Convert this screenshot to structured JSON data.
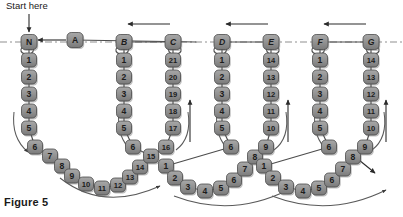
{
  "figure": {
    "caption": "Figure 5",
    "start_label": "Start here"
  },
  "colors": {
    "node_fill": "#8c8c8c",
    "node_fill_light": "#a6a6a6",
    "node_stroke": "#4a4a4a",
    "node_text": "#1c1c1c",
    "link": "#4d4d4d",
    "dashed_axis": "#8f8f8f",
    "arc": "#5a5a5a",
    "arrow": "#2b2b2b",
    "caption_text": "#1a1a1a",
    "background": "#ffffff"
  },
  "axis": {
    "y": 42,
    "style": "dash-dot",
    "label": "horizontal-reference-line"
  },
  "letter_nodes": [
    {
      "id": "N",
      "label": "N",
      "x": 29,
      "y": 42,
      "italic": false
    },
    {
      "id": "A",
      "label": "A",
      "x": 75,
      "y": 40,
      "italic": false
    },
    {
      "id": "B",
      "label": "B",
      "x": 124,
      "y": 42,
      "italic": true
    },
    {
      "id": "C",
      "label": "C",
      "x": 173,
      "y": 42,
      "italic": true
    },
    {
      "id": "D",
      "label": "D",
      "x": 222,
      "y": 42,
      "italic": true
    },
    {
      "id": "E",
      "label": "E",
      "x": 271,
      "y": 42,
      "italic": true
    },
    {
      "id": "F",
      "label": "F",
      "x": 320,
      "y": 42,
      "italic": true
    },
    {
      "id": "G",
      "label": "G",
      "x": 371,
      "y": 42,
      "italic": true
    }
  ],
  "columns": [
    {
      "name": "col-N-down",
      "letter": "N",
      "x": 29,
      "start_y": 60,
      "step": 17,
      "values": [
        "1",
        "2",
        "3",
        "4",
        "5"
      ]
    },
    {
      "name": "col-B-down",
      "letter": "B",
      "x": 124,
      "start_y": 60,
      "step": 17,
      "values": [
        "1",
        "2",
        "3",
        "4",
        "5"
      ]
    },
    {
      "name": "col-C-up",
      "letter": "C",
      "x": 173,
      "start_y": 60,
      "step": 17,
      "values": [
        "21",
        "20",
        "19",
        "18",
        "17"
      ]
    },
    {
      "name": "col-D-down",
      "letter": "D",
      "x": 222,
      "start_y": 60,
      "step": 17,
      "values": [
        "1",
        "2",
        "3",
        "4",
        "5"
      ]
    },
    {
      "name": "col-E-up",
      "letter": "E",
      "x": 271,
      "start_y": 60,
      "step": 17,
      "values": [
        "14",
        "13",
        "12",
        "11",
        "10"
      ]
    },
    {
      "name": "col-F-down",
      "letter": "F",
      "x": 320,
      "start_y": 60,
      "step": 17,
      "values": [
        "1",
        "2",
        "3",
        "4",
        "5"
      ]
    },
    {
      "name": "col-G-up",
      "letter": "G",
      "x": 371,
      "start_y": 60,
      "step": 17,
      "values": [
        "14",
        "13",
        "12",
        "11",
        "10"
      ]
    }
  ],
  "arc_nodes": [
    {
      "name": "arc1-node",
      "label": "6",
      "x": 35,
      "y": 147
    },
    {
      "name": "arc1-node",
      "label": "7",
      "x": 50,
      "y": 156
    },
    {
      "name": "arc1-node",
      "label": "8",
      "x": 62,
      "y": 166
    },
    {
      "name": "arc1-node",
      "label": "9",
      "x": 72,
      "y": 176
    },
    {
      "name": "arc1-node",
      "label": "10",
      "x": 86,
      "y": 184
    },
    {
      "name": "arc1-node",
      "label": "11",
      "x": 102,
      "y": 188
    },
    {
      "name": "arc1-node",
      "label": "12",
      "x": 118,
      "y": 185
    },
    {
      "name": "arc1-node",
      "label": "13",
      "x": 130,
      "y": 177
    },
    {
      "name": "arc1-node",
      "label": "14",
      "x": 140,
      "y": 167
    },
    {
      "name": "arc1-node",
      "label": "15",
      "x": 151,
      "y": 156
    },
    {
      "name": "arc1-node",
      "label": "16",
      "x": 166,
      "y": 147
    },
    {
      "name": "arc2-node",
      "label": "1",
      "x": 166,
      "y": 166
    },
    {
      "name": "arc2-node",
      "label": "2",
      "x": 175,
      "y": 178
    },
    {
      "name": "arc2-node",
      "label": "3",
      "x": 188,
      "y": 187
    },
    {
      "name": "arc2-node",
      "label": "4",
      "x": 205,
      "y": 191
    },
    {
      "name": "arc2-node",
      "label": "5",
      "x": 221,
      "y": 188
    },
    {
      "name": "arc2-node",
      "label": "6",
      "x": 234,
      "y": 180
    },
    {
      "name": "arc2-node",
      "label": "7",
      "x": 245,
      "y": 169
    },
    {
      "name": "arc2-node",
      "label": "8",
      "x": 255,
      "y": 157
    },
    {
      "name": "arc2-node",
      "label": "9",
      "x": 266,
      "y": 147
    },
    {
      "name": "arc3-node",
      "label": "1",
      "x": 264,
      "y": 166
    },
    {
      "name": "arc3-node",
      "label": "2",
      "x": 273,
      "y": 178
    },
    {
      "name": "arc3-node",
      "label": "3",
      "x": 286,
      "y": 187
    },
    {
      "name": "arc3-node",
      "label": "4",
      "x": 303,
      "y": 191
    },
    {
      "name": "arc3-node",
      "label": "5",
      "x": 319,
      "y": 188
    },
    {
      "name": "arc3-node",
      "label": "6",
      "x": 332,
      "y": 180
    },
    {
      "name": "arc3-node",
      "label": "7",
      "x": 343,
      "y": 169
    },
    {
      "name": "arc3-node",
      "label": "8",
      "x": 353,
      "y": 157
    },
    {
      "name": "arc3-node",
      "label": "9",
      "x": 365,
      "y": 147
    }
  ],
  "arc_left_nodes": [
    {
      "name": "arcL-node",
      "label": "6",
      "x": 133,
      "y": 147
    },
    {
      "name": "arcL-node",
      "label": "6",
      "x": 231,
      "y": 147
    },
    {
      "name": "arcL-node",
      "label": "6",
      "x": 329,
      "y": 147
    }
  ],
  "arrows": {
    "start_down": {
      "x1": 29,
      "y1": 14,
      "x2": 29,
      "y2": 32
    },
    "A_to_N": {
      "x1": 66,
      "y1": 40,
      "x2": 38,
      "y2": 40
    },
    "top_BC": {
      "x1": 170,
      "y1": 24,
      "x2": 128,
      "y2": 24
    },
    "top_DE": {
      "x1": 268,
      "y1": 24,
      "x2": 226,
      "y2": 24
    },
    "top_FG": {
      "x1": 366,
      "y1": 24,
      "x2": 324,
      "y2": 24
    },
    "up_C": {
      "x1": 190,
      "y1": 142,
      "x2": 190,
      "y2": 100
    },
    "up_E": {
      "x1": 288,
      "y1": 142,
      "x2": 288,
      "y2": 100
    },
    "up_G": {
      "x1": 386,
      "y1": 142,
      "x2": 386,
      "y2": 100
    },
    "down_N": {
      "x1": 17,
      "y1": 110,
      "x2": 17,
      "y2": 152
    },
    "down_D": {
      "x1": 210,
      "y1": 110,
      "x2": 210,
      "y2": 152
    },
    "down_F": {
      "x1": 308,
      "y1": 110,
      "x2": 308,
      "y2": 152
    },
    "exit_arrow": {
      "x1": 359,
      "y1": 160,
      "x2": 375,
      "y2": 173
    }
  },
  "arc_sweeps": [
    {
      "name": "bottom-sweep-1",
      "path": "M 46 178 Q 103 218 163 180"
    },
    {
      "name": "bottom-sweep-2",
      "path": "M 181 196 Q 238 222 289 193"
    },
    {
      "name": "bottom-sweep-3",
      "path": "M 20 203 Q 62 213 100 202"
    }
  ]
}
